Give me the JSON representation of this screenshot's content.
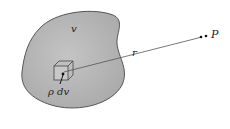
{
  "diagram": {
    "type": "physics-gravitation",
    "labels": {
      "volume": "v",
      "distance": "r",
      "point": "P",
      "element": "ρ dv"
    },
    "colors": {
      "body_fill": "#bdbdbd",
      "body_stroke": "#555555",
      "line": "#555555",
      "text": "#222222"
    }
  }
}
